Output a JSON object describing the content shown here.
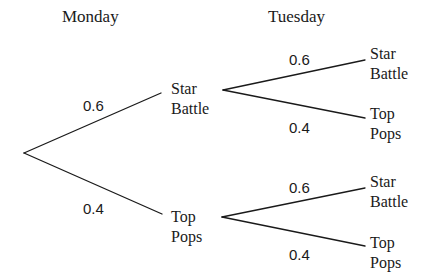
{
  "headers": {
    "stage1": "Monday",
    "stage2": "Tuesday"
  },
  "tree": {
    "root": "",
    "monday": [
      {
        "line1": "Star",
        "line2": "Battle",
        "probability": "0.6",
        "tuesday": [
          {
            "line1": "Star",
            "line2": "Battle",
            "probability": "0.6"
          },
          {
            "line1": "Top",
            "line2": "Pops",
            "probability": "0.4"
          }
        ]
      },
      {
        "line1": "Top",
        "line2": "Pops",
        "probability": "0.4",
        "tuesday": [
          {
            "line1": "Star",
            "line2": "Battle",
            "probability": "0.6"
          },
          {
            "line1": "Top",
            "line2": "Pops",
            "probability": "0.4"
          }
        ]
      }
    ]
  },
  "colors": {
    "ink": "#1a1a1a",
    "background": "#ffffff"
  }
}
